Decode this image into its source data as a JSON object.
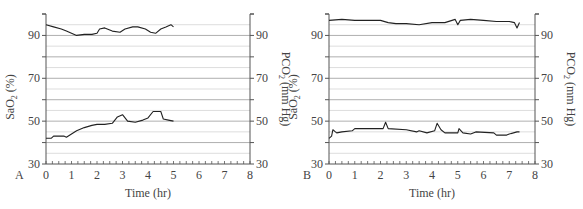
{
  "chart_data": [
    {
      "type": "line",
      "panel_label": "A",
      "xlabel": "Time (hr)",
      "ylabel_left": "SaO2 (%)",
      "ylabel_right": "PCO2 (mm Hg)",
      "xlim": [
        0,
        8
      ],
      "ylim": [
        30,
        100
      ],
      "x_ticks": [
        0,
        1,
        2,
        3,
        4,
        5,
        6,
        7,
        8
      ],
      "y_ticks_left": [
        30,
        50,
        70,
        90
      ],
      "y_ticks_right": [
        30,
        50,
        70,
        90
      ],
      "grid": true,
      "series": [
        {
          "name": "SaO2",
          "x": [
            0,
            0.3,
            0.6,
            0.8,
            1.0,
            1.2,
            1.5,
            1.8,
            2.0,
            2.1,
            2.3,
            2.6,
            2.9,
            3.1,
            3.4,
            3.6,
            3.9,
            4.1,
            4.3,
            4.5,
            4.7,
            4.9,
            5.0
          ],
          "values": [
            95,
            94,
            93,
            92,
            91,
            90,
            90.5,
            90.5,
            91,
            93,
            93.5,
            92,
            91.5,
            93,
            94,
            94,
            93,
            91.5,
            91,
            93,
            94,
            95,
            94
          ]
        },
        {
          "name": "PCO2",
          "x": [
            0,
            0.2,
            0.3,
            0.7,
            0.8,
            1.0,
            1.2,
            1.5,
            1.8,
            2.0,
            2.3,
            2.6,
            2.8,
            3.0,
            3.2,
            3.5,
            3.8,
            4.0,
            4.2,
            4.5,
            4.6,
            4.8,
            5.0
          ],
          "values": [
            42,
            42,
            43,
            43,
            42.5,
            44,
            45.5,
            47,
            48,
            48.5,
            48.5,
            49,
            52,
            53,
            50,
            49.5,
            50.5,
            51.5,
            54.5,
            54.5,
            51,
            50.5,
            50
          ]
        }
      ]
    },
    {
      "type": "line",
      "panel_label": "B",
      "xlabel": "Time (hr)",
      "ylabel_left": "SaO2 (%)",
      "ylabel_right": "PCO2 (mm Hg)",
      "xlim": [
        0,
        8
      ],
      "ylim": [
        30,
        100
      ],
      "x_ticks": [
        0,
        1,
        2,
        3,
        4,
        5,
        6,
        7,
        8
      ],
      "y_ticks_left": [
        30,
        50,
        70,
        90
      ],
      "y_ticks_right": [
        30,
        50,
        70,
        90
      ],
      "grid": true,
      "series": [
        {
          "name": "SaO2",
          "x": [
            0,
            0.5,
            1.0,
            1.5,
            2.0,
            2.3,
            2.6,
            3.0,
            3.5,
            4.0,
            4.5,
            4.9,
            5.0,
            5.1,
            5.5,
            6.0,
            6.5,
            7.0,
            7.2,
            7.3,
            7.4
          ],
          "values": [
            97,
            97.5,
            97,
            97,
            97,
            96,
            95.5,
            95.5,
            95,
            96,
            96,
            97.5,
            95,
            97,
            97.5,
            97,
            96.5,
            96.5,
            96,
            93.5,
            96
          ]
        },
        {
          "name": "PCO2",
          "x": [
            0,
            0.1,
            0.15,
            0.25,
            0.3,
            0.5,
            0.9,
            1.0,
            2.1,
            2.2,
            2.3,
            3.0,
            3.4,
            3.5,
            3.8,
            4.1,
            4.2,
            4.35,
            4.5,
            5.0,
            5.05,
            5.2,
            5.5,
            5.7,
            6.4,
            6.5,
            6.9,
            7.0,
            7.3,
            7.4
          ],
          "values": [
            42,
            43,
            46,
            45,
            44.5,
            45,
            45.5,
            46.5,
            46.5,
            49.5,
            46.5,
            46,
            45,
            45.5,
            44.5,
            45.5,
            49,
            46,
            44.5,
            44.5,
            46.5,
            44.5,
            44,
            45,
            44.5,
            43.5,
            43.5,
            44,
            45,
            45
          ]
        }
      ]
    }
  ],
  "panels": [
    {
      "letter": "A",
      "xlabel": "Time (hr)",
      "ylabel_left": "SaO",
      "ylabel_left_sub": "2",
      "ylabel_left_unit": " (%)",
      "ylabel_right": "PCO",
      "ylabel_right_sub": "2",
      "ylabel_right_unit": " (mm Hg)"
    },
    {
      "letter": "B",
      "xlabel": "Time (hr)",
      "ylabel_left": "SaO",
      "ylabel_left_sub": "2",
      "ylabel_left_unit": " (%)",
      "ylabel_right": "PCO",
      "ylabel_right_sub": "2",
      "ylabel_right_unit": " (mm Hg)"
    }
  ],
  "colors": {
    "axis": "#555555",
    "grid_major": "#9a9a9a",
    "grid_minor": "#dddddd",
    "trace": "#222222"
  }
}
